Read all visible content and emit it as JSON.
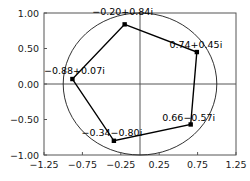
{
  "chart_data": {
    "type": "scatter",
    "title": "",
    "xlabel": "",
    "ylabel": "",
    "xlim": [
      -1.25,
      1.25
    ],
    "ylim": [
      -1.0,
      1.0
    ],
    "grid": false,
    "legend": "none",
    "zero_axes": true,
    "unit_circle": {
      "center": [
        0,
        0
      ],
      "radius": 1.0,
      "label": "unit-circle"
    },
    "xticks": [
      "-1.25",
      "-0.75",
      "-0.25",
      "0.25",
      "0.75",
      "1.25"
    ],
    "xtick_values": [
      -1.25,
      -0.75,
      -0.25,
      0.25,
      0.75,
      1.25
    ],
    "yticks": [
      "1.00",
      "0.50",
      "0.00",
      "-0.50",
      "-1.00"
    ],
    "ytick_values": [
      1.0,
      0.5,
      0.0,
      -0.5,
      -1.0
    ],
    "points": [
      {
        "label": "-0.20+0.84i",
        "x": -0.2,
        "y": 0.84,
        "label_dx": -2,
        "label_dy": -9,
        "anchor": "middle"
      },
      {
        "label": "0.74+0.45i",
        "x": 0.74,
        "y": 0.45,
        "label_dx": -1,
        "label_dy": -4,
        "anchor": "middle"
      },
      {
        "label": "0.66-0.57i",
        "x": 0.66,
        "y": -0.57,
        "label_dx": -2,
        "label_dy": -3,
        "anchor": "middle"
      },
      {
        "label": "-0.34-0.80i",
        "x": -0.34,
        "y": -0.8,
        "label_dx": -2,
        "label_dy": -5,
        "anchor": "middle"
      },
      {
        "label": "-0.88+0.07i",
        "x": -0.88,
        "y": 0.07,
        "label_dx": 2,
        "label_dy": -5,
        "anchor": "middle"
      }
    ],
    "polygon_order": [
      0,
      1,
      2,
      3,
      4
    ],
    "colors": {
      "line": "#000000",
      "marker": "#000000",
      "axis": "#555555",
      "frame": "#555555",
      "circle": "#1a1a1a"
    }
  }
}
